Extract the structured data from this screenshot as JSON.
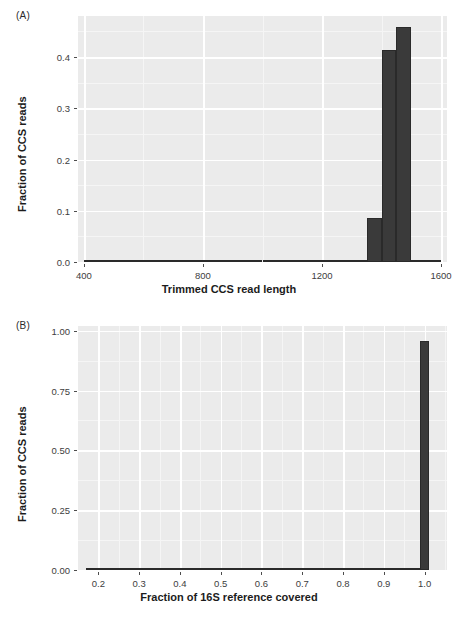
{
  "figure": {
    "panels": [
      {
        "tag": "(A)",
        "ylabel": "Fraction of CCS reads",
        "xlabel": "Trimmed CCS read length"
      },
      {
        "tag": "(B)",
        "ylabel": "Fraction of CCS reads",
        "xlabel": "Fraction of 16S reference covered"
      }
    ],
    "colors": {
      "panel_background": "#EBEBEB",
      "gridline_major": "#FFFFFF",
      "gridline_minor": "#F5F5F5",
      "bar_fill": "#3A3A3A",
      "text": "#1C1C1C",
      "page_background": "#FFFFFF"
    }
  },
  "chart_data": [
    {
      "type": "bar",
      "panel": "(A)",
      "title": "",
      "xlabel": "Trimmed CCS read length",
      "ylabel": "Fraction of CCS reads",
      "xlim": [
        380,
        1620
      ],
      "ylim": [
        0,
        0.48
      ],
      "xticks": [
        400,
        800,
        1200,
        1600
      ],
      "xtick_labels": [
        "400",
        "800",
        "1200",
        "1600"
      ],
      "xticks_minor": [
        600,
        1000,
        1400
      ],
      "yticks": [
        0.0,
        0.1,
        0.2,
        0.3,
        0.4
      ],
      "ytick_labels": [
        "0.0",
        "0.1",
        "0.2",
        "0.3",
        "0.4"
      ],
      "yticks_minor": [
        0.05,
        0.15,
        0.25,
        0.35,
        0.45
      ],
      "grid": true,
      "bin_width": 50,
      "bin_starts": [
        400,
        450,
        500,
        550,
        600,
        650,
        700,
        750,
        800,
        850,
        900,
        950,
        1000,
        1050,
        1100,
        1150,
        1200,
        1250,
        1300,
        1350,
        1400,
        1450,
        1500,
        1550
      ],
      "values": [
        0.0005,
        0.0005,
        0.0008,
        0.001,
        0.0022,
        0.0022,
        0.0028,
        0.0035,
        0.0042,
        0.0035,
        0.0022,
        0.0022,
        0.0028,
        0.0038,
        0.0038,
        0.0035,
        0.0035,
        0.0022,
        0.0015,
        0.085,
        0.414,
        0.458,
        0.0015,
        0.0008
      ]
    },
    {
      "type": "bar",
      "panel": "(B)",
      "title": "",
      "xlabel": "Fraction of 16S reference covered",
      "ylabel": "Fraction of CCS reads",
      "xlim": [
        0.15,
        1.055
      ],
      "ylim": [
        0,
        1.02
      ],
      "xticks": [
        0.2,
        0.3,
        0.4,
        0.5,
        0.6,
        0.7,
        0.8,
        0.9,
        1.0
      ],
      "xtick_labels": [
        "0.2",
        "0.3",
        "0.4",
        "0.5",
        "0.6",
        "0.7",
        "0.8",
        "0.9",
        "1.0"
      ],
      "xticks_minor": [
        0.25,
        0.35,
        0.45,
        0.55,
        0.65,
        0.75,
        0.85,
        0.95,
        1.05
      ],
      "yticks": [
        0.0,
        0.25,
        0.5,
        0.75,
        1.0
      ],
      "ytick_labels": [
        "0.00",
        "0.25",
        "0.50",
        "0.75",
        "1.00"
      ],
      "yticks_minor": [
        0.125,
        0.375,
        0.625,
        0.875
      ],
      "grid": true,
      "bin_width": 0.02,
      "bin_starts": [
        0.17,
        0.19,
        0.21,
        0.23,
        0.25,
        0.27,
        0.29,
        0.31,
        0.33,
        0.35,
        0.37,
        0.39,
        0.41,
        0.43,
        0.45,
        0.47,
        0.49,
        0.51,
        0.53,
        0.55,
        0.57,
        0.59,
        0.61,
        0.63,
        0.65,
        0.67,
        0.69,
        0.71,
        0.73,
        0.75,
        0.77,
        0.79,
        0.81,
        0.83,
        0.85,
        0.87,
        0.89,
        0.91,
        0.93,
        0.95,
        0.97,
        0.99
      ],
      "values": [
        0.0004,
        0.0004,
        0.0004,
        0.0004,
        0.0005,
        0.0005,
        0.0005,
        0.0006,
        0.0006,
        0.0006,
        0.0007,
        0.0007,
        0.0008,
        0.0008,
        0.0009,
        0.001,
        0.0032,
        0.0032,
        0.0014,
        0.0014,
        0.0016,
        0.0034,
        0.0016,
        0.0018,
        0.0036,
        0.0018,
        0.002,
        0.002,
        0.0038,
        0.0022,
        0.0024,
        0.0038,
        0.0026,
        0.0028,
        0.0048,
        0.0052,
        0.003,
        0.0032,
        0.0034,
        0.0036,
        0.0038,
        0.958
      ]
    }
  ]
}
